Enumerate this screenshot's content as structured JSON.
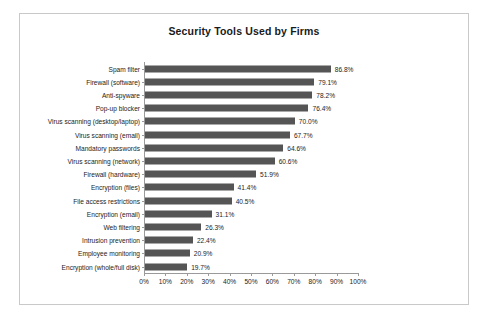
{
  "chart_data": {
    "type": "bar",
    "orientation": "horizontal",
    "title": "Security Tools Used by Firms",
    "xlabel": "",
    "ylabel": "",
    "xlim": [
      0,
      100
    ],
    "grid": false,
    "legend": null,
    "bar_color": "#555555",
    "frame_color": "#c9c9c9",
    "axis_color": "#9a9a9a",
    "xticks": [
      "0%",
      "10%",
      "20%",
      "30%",
      "40%",
      "50%",
      "60%",
      "70%",
      "80%",
      "90%",
      "100%"
    ],
    "xtick_values": [
      0,
      10,
      20,
      30,
      40,
      50,
      60,
      70,
      80,
      90,
      100
    ],
    "categories": [
      "Spam filter",
      "Firewall (software)",
      "Anti-spyware",
      "Pop-up blocker",
      "Virus scanning (desktop/laptop)",
      "Virus scanning (email)",
      "Mandatory passwords",
      "Virus scanning (network)",
      "Firewall (hardware)",
      "Encryption (files)",
      "File access restrictions",
      "Encryption (email)",
      "Web filtering",
      "Intrusion prevention",
      "Employee monitoring",
      "Encryption (whole/full disk)"
    ],
    "values": [
      86.8,
      79.1,
      78.2,
      76.4,
      70.0,
      67.7,
      64.6,
      60.6,
      51.9,
      41.4,
      40.5,
      31.1,
      26.3,
      22.4,
      20.9,
      19.7
    ],
    "value_labels": [
      "86.8%",
      "79.1%",
      "78.2%",
      "76.4%",
      "70.0%",
      "67.7%",
      "64.6%",
      "60.6%",
      "51.9%",
      "41.4%",
      "40.5%",
      "31.1%",
      "26.3%",
      "22.4%",
      "20.9%",
      "19.7%"
    ]
  }
}
